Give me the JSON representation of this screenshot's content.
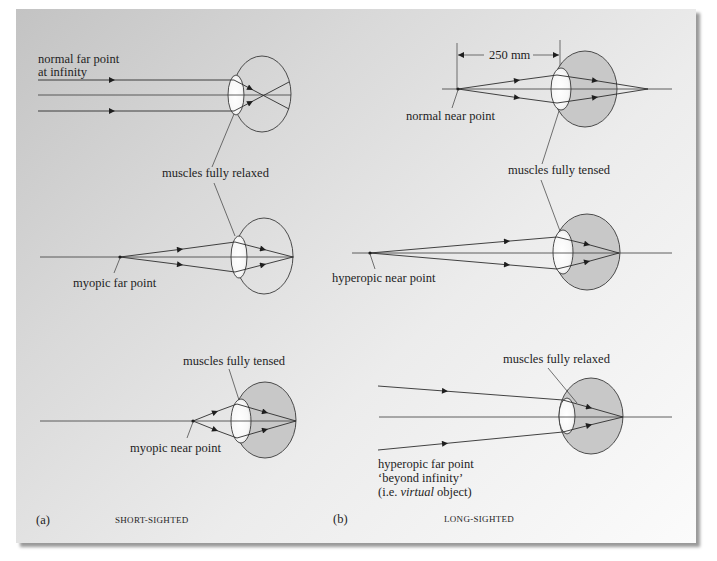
{
  "figure": {
    "panel_a": {
      "label": "(a)",
      "caption": "SHORT-SIGHTED",
      "top": {
        "object_label_line1": "normal far point",
        "object_label_line2": "at infinity"
      },
      "shared_muscles_label": "muscles fully relaxed",
      "middle": {
        "point_label": "myopic far point"
      },
      "bottom": {
        "muscles_label": "muscles fully tensed",
        "point_label": "myopic near point"
      }
    },
    "panel_b": {
      "label": "(b)",
      "caption": "LONG-SIGHTED",
      "top": {
        "dimension_label": "250 mm",
        "point_label": "normal near point"
      },
      "shared_muscles_label": "muscles fully tensed",
      "middle": {
        "point_label": "hyperopic near point"
      },
      "bottom": {
        "muscles_label": "muscles fully relaxed",
        "point_label_line1": "hyperopic far point",
        "point_label_line2": "‘beyond infinity’",
        "point_label_line3_pre": "(i.e. ",
        "point_label_line3_italic": "virtual",
        "point_label_line3_post": " object)"
      }
    },
    "colors": {
      "line": "#2e2e2e",
      "eye_shading": "#c8c8c8",
      "lens": "#ffffff",
      "background_start": "#c3c3c3",
      "background_end": "#fbfbfb"
    }
  }
}
